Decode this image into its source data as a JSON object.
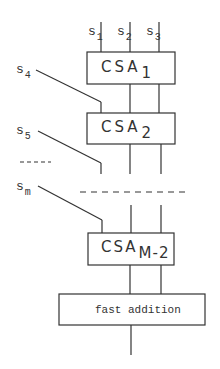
{
  "diagram": {
    "inputs_top": [
      {
        "base": "s",
        "sub": "1"
      },
      {
        "base": "s",
        "sub": "2"
      },
      {
        "base": "s",
        "sub": "3"
      }
    ],
    "inputs_side": [
      {
        "base": "s",
        "sub": "4"
      },
      {
        "base": "s",
        "sub": "5"
      },
      {
        "base": "s",
        "sub": "m"
      }
    ],
    "ellipsis": "-----",
    "blocks": [
      {
        "base": "CSA",
        "sub": "1"
      },
      {
        "base": "CSA",
        "sub": "2"
      },
      {
        "base": "CSA",
        "sub": "M-2"
      }
    ],
    "final_block": "fast addition"
  }
}
